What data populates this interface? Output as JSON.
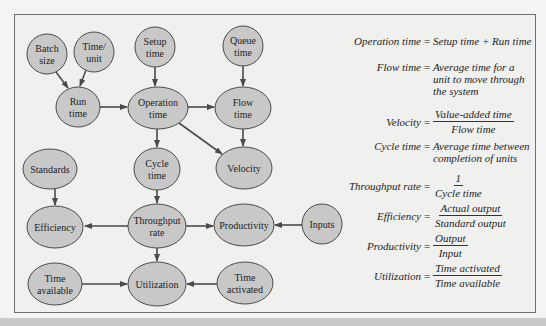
{
  "colors": {
    "background": "#f4f4f2",
    "frame_fill": "#f0f0ee",
    "frame_border": "#707070",
    "node_fill": "#c8c8c8",
    "node_stroke": "#4a4a4a",
    "arrow": "#4a4a4a",
    "text": "#222222"
  },
  "nodes": [
    {
      "id": "batch_size",
      "lines": [
        "Batch",
        "size"
      ],
      "cx": 47,
      "cy": 54,
      "rx": 20,
      "ry": 20
    },
    {
      "id": "time_unit",
      "lines": [
        "Time/",
        "unit"
      ],
      "cx": 94,
      "cy": 52,
      "rx": 20,
      "ry": 20
    },
    {
      "id": "setup_time",
      "lines": [
        "Setup",
        "time"
      ],
      "cx": 155,
      "cy": 47,
      "rx": 20,
      "ry": 20
    },
    {
      "id": "queue_time",
      "lines": [
        "Queue",
        "time"
      ],
      "cx": 243,
      "cy": 46,
      "rx": 20,
      "ry": 20
    },
    {
      "id": "run_time",
      "lines": [
        "Run",
        "time"
      ],
      "cx": 78,
      "cy": 107,
      "rx": 22,
      "ry": 20
    },
    {
      "id": "operation_time",
      "lines": [
        "Operation",
        "time"
      ],
      "cx": 158,
      "cy": 108,
      "rx": 30,
      "ry": 21
    },
    {
      "id": "flow_time",
      "lines": [
        "Flow",
        "time"
      ],
      "cx": 243,
      "cy": 108,
      "rx": 28,
      "ry": 21
    },
    {
      "id": "standards",
      "lines": [
        "Standards"
      ],
      "cx": 50,
      "cy": 169,
      "rx": 27,
      "ry": 20
    },
    {
      "id": "cycle_time",
      "lines": [
        "Cycle",
        "time"
      ],
      "cx": 157,
      "cy": 169,
      "rx": 23,
      "ry": 21
    },
    {
      "id": "velocity",
      "lines": [
        "Velocity"
      ],
      "cx": 244,
      "cy": 168,
      "rx": 28,
      "ry": 21
    },
    {
      "id": "efficiency",
      "lines": [
        "Efficiency"
      ],
      "cx": 55,
      "cy": 227,
      "rx": 28,
      "ry": 21
    },
    {
      "id": "throughput_rate",
      "lines": [
        "Throughput",
        "rate"
      ],
      "cx": 157,
      "cy": 226,
      "rx": 29,
      "ry": 22
    },
    {
      "id": "productivity",
      "lines": [
        "Productivity"
      ],
      "cx": 244,
      "cy": 225,
      "rx": 30,
      "ry": 21
    },
    {
      "id": "inputs",
      "lines": [
        "Inputs"
      ],
      "cx": 322,
      "cy": 224,
      "rx": 20,
      "ry": 20
    },
    {
      "id": "time_available",
      "lines": [
        "Time",
        "available"
      ],
      "cx": 55,
      "cy": 284,
      "rx": 27,
      "ry": 21
    },
    {
      "id": "utilization",
      "lines": [
        "Utilization"
      ],
      "cx": 157,
      "cy": 284,
      "rx": 29,
      "ry": 22
    },
    {
      "id": "time_activated",
      "lines": [
        "Time",
        "activated"
      ],
      "cx": 245,
      "cy": 283,
      "rx": 28,
      "ry": 21
    }
  ],
  "edges": [
    {
      "from": "batch_size",
      "to": "run_time",
      "x1": 56,
      "y1": 72,
      "x2": 68,
      "y2": 88
    },
    {
      "from": "time_unit",
      "to": "run_time",
      "x1": 86,
      "y1": 70,
      "x2": 80,
      "y2": 86
    },
    {
      "from": "setup_time",
      "to": "operation_time",
      "x1": 155,
      "y1": 67,
      "x2": 155,
      "y2": 86
    },
    {
      "from": "queue_time",
      "to": "flow_time",
      "x1": 243,
      "y1": 66,
      "x2": 243,
      "y2": 86
    },
    {
      "from": "run_time",
      "to": "operation_time",
      "x1": 100,
      "y1": 107,
      "x2": 127,
      "y2": 107
    },
    {
      "from": "operation_time",
      "to": "flow_time",
      "x1": 188,
      "y1": 107,
      "x2": 214,
      "y2": 107
    },
    {
      "from": "operation_time",
      "to": "cycle_time",
      "x1": 157,
      "y1": 129,
      "x2": 157,
      "y2": 147
    },
    {
      "from": "operation_time",
      "to": "velocity",
      "x1": 179,
      "y1": 123,
      "x2": 222,
      "y2": 154
    },
    {
      "from": "flow_time",
      "to": "velocity",
      "x1": 243,
      "y1": 129,
      "x2": 243,
      "y2": 146
    },
    {
      "from": "standards",
      "to": "efficiency",
      "x1": 55,
      "y1": 189,
      "x2": 55,
      "y2": 205
    },
    {
      "from": "cycle_time",
      "to": "throughput_rate",
      "x1": 157,
      "y1": 190,
      "x2": 157,
      "y2": 203
    },
    {
      "from": "throughput_rate",
      "to": "efficiency",
      "x1": 128,
      "y1": 226,
      "x2": 85,
      "y2": 226
    },
    {
      "from": "throughput_rate",
      "to": "productivity",
      "x1": 186,
      "y1": 226,
      "x2": 213,
      "y2": 226
    },
    {
      "from": "inputs",
      "to": "productivity",
      "x1": 302,
      "y1": 225,
      "x2": 275,
      "y2": 225
    },
    {
      "from": "throughput_rate",
      "to": "utilization",
      "x1": 157,
      "y1": 248,
      "x2": 157,
      "y2": 261
    },
    {
      "from": "time_available",
      "to": "utilization",
      "x1": 82,
      "y1": 284,
      "x2": 127,
      "y2": 284
    },
    {
      "from": "time_activated",
      "to": "utilization",
      "x1": 217,
      "y1": 284,
      "x2": 187,
      "y2": 284
    }
  ],
  "formulas": {
    "operation_time": {
      "lhs": "Operation time",
      "equals": "=",
      "rhs": "Setup time + Run time"
    },
    "flow_time": {
      "lhs": "Flow time",
      "equals": "=",
      "rhs_lines": [
        "Average time for a",
        "unit to move through",
        "the system"
      ]
    },
    "velocity": {
      "lhs": "Velocity",
      "equals": "=",
      "numerator": "Value-added time",
      "denominator": "Flow time"
    },
    "cycle_time": {
      "lhs": "Cycle time",
      "equals": "=",
      "rhs_lines": [
        "Average time between",
        "completion of units"
      ]
    },
    "throughput_rate": {
      "lhs": "Throughput rate",
      "equals": "=",
      "numerator": "1",
      "denominator": "Cycle time"
    },
    "efficiency": {
      "lhs": "Efficiency",
      "equals": "=",
      "numerator": "Actual output",
      "denominator": "Standard output"
    },
    "productivity": {
      "lhs": "Productivity",
      "equals": "=",
      "numerator": "Output",
      "denominator": "Input"
    },
    "utilization": {
      "lhs": "Utilization",
      "equals": "=",
      "numerator": "Time activated",
      "denominator": "Time available"
    }
  }
}
